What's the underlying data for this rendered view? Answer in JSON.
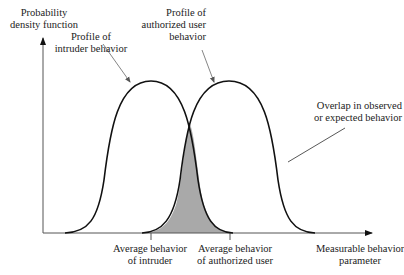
{
  "diagram": {
    "y_axis_label": [
      "Probability",
      "density function"
    ],
    "x_axis_label": [
      "Measurable behavior",
      "parameter"
    ],
    "curves": [
      {
        "name": "intruder",
        "label": [
          "Profile of",
          "intruder behavior"
        ],
        "mean_label": [
          "Average behavior",
          "of intruder"
        ]
      },
      {
        "name": "authorized-user",
        "label": [
          "Profile of",
          "authorized user",
          "behavior"
        ],
        "mean_label": [
          "Average behavior",
          "of authorized user"
        ]
      }
    ],
    "overlap_label": [
      "Overlap in observed",
      "or expected behavior"
    ],
    "colors": {
      "line": "#111111",
      "shade": "#a9a9a9",
      "axis": "#555555",
      "leader": "#666666"
    }
  }
}
